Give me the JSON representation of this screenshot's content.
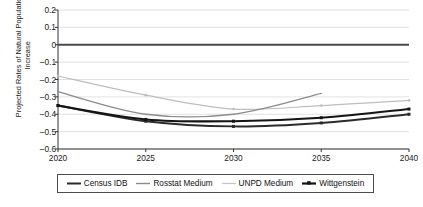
{
  "chart_data": {
    "type": "line",
    "title": "",
    "xlabel": "",
    "ylabel": "Projected Rates of Natural Population Increase",
    "x": [
      2020,
      2021,
      2022,
      2023,
      2024,
      2025,
      2026,
      2027,
      2028,
      2029,
      2030,
      2031,
      2032,
      2033,
      2034,
      2035,
      2036,
      2037,
      2038,
      2039,
      2040
    ],
    "xlim": [
      2020,
      2040
    ],
    "ylim": [
      -0.6,
      0.2
    ],
    "xticks": [
      2020,
      2025,
      2030,
      2035,
      2040
    ],
    "yticks": [
      0.2,
      0.1,
      0,
      -0.1,
      -0.2,
      -0.3,
      -0.4,
      -0.5,
      -0.6
    ],
    "ytick_labels": [
      "0.2",
      "0.1",
      "0",
      "–0.1",
      "–0.2",
      "–0.3",
      "–0.4",
      "–0.5",
      "–0.6"
    ],
    "xtick_labels": [
      "2020",
      "2025",
      "2030",
      "2035",
      "2040"
    ],
    "grid": true,
    "grid_axis": "y",
    "zero_line": 0,
    "legend_position": "bottom",
    "series": [
      {
        "name": "Census IDB",
        "color": "#2b2b2b",
        "width": 1.9,
        "marker": "square",
        "x": [
          2020,
          2025,
          2030,
          2035,
          2040
        ],
        "values": [
          -0.35,
          -0.44,
          -0.47,
          -0.45,
          -0.4
        ]
      },
      {
        "name": "Rosstat Medium",
        "color": "#8c8c8c",
        "width": 1.3,
        "marker": "none",
        "x": [
          2020,
          2025,
          2030,
          2035
        ],
        "values": [
          -0.27,
          -0.4,
          -0.4,
          -0.28
        ]
      },
      {
        "name": "UNPD Medium",
        "color": "#bdbdbd",
        "width": 1.2,
        "marker": "dot",
        "x": [
          2020,
          2025,
          2030,
          2035,
          2040
        ],
        "values": [
          -0.18,
          -0.29,
          -0.37,
          -0.35,
          -0.32
        ]
      },
      {
        "name": "Wittgenstein",
        "color": "#141414",
        "width": 2.1,
        "marker": "square",
        "x": [
          2020,
          2025,
          2030,
          2035,
          2040
        ],
        "values": [
          -0.35,
          -0.43,
          -0.44,
          -0.42,
          -0.37
        ]
      }
    ]
  },
  "legend": {
    "items": [
      {
        "label": "Census IDB",
        "color": "#2b2b2b",
        "width": 2.0,
        "marker": "none"
      },
      {
        "label": "Rosstat Medium",
        "color": "#8c8c8c",
        "width": 1.4,
        "marker": "none"
      },
      {
        "label": "UNPD Medium",
        "color": "#c4c4c4",
        "width": 1.2,
        "marker": "none"
      },
      {
        "label": "Wittgenstein",
        "color": "#141414",
        "width": 2.2,
        "marker": "square"
      }
    ]
  },
  "axes": {
    "y_title": "Projected Rates of Natural Population Increase"
  },
  "colors": {
    "grid": "#d9d9d9",
    "axis": "#333333",
    "zero_line": "#4a4a4a",
    "text": "#1a1a1a",
    "legend_border": "#4d4d4d",
    "background": "#ffffff"
  }
}
